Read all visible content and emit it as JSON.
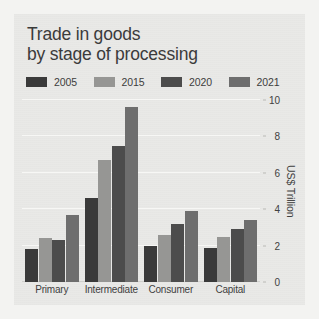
{
  "figure": {
    "title_line1": "Trade in goods",
    "title_line2": "by stage of processing",
    "background": "#e9e9e7",
    "page_background": "#f3f3f1"
  },
  "legend": {
    "position": "top",
    "entries": [
      {
        "label": "2005",
        "color": "#3a3a3a"
      },
      {
        "label": "2015",
        "color": "#969694"
      },
      {
        "label": "2020",
        "color": "#4c4c4c"
      },
      {
        "label": "2021",
        "color": "#6e6e6e"
      }
    ]
  },
  "chart_data": {
    "type": "bar",
    "title": "Trade in goods by stage of processing",
    "xlabel": "",
    "ylabel": "US$ Trillion",
    "categories": [
      "Primary",
      "Intermediate",
      "Consumer",
      "Capital"
    ],
    "series": [
      {
        "name": "2005",
        "color": "#3a3a3a",
        "values": [
          1.8,
          4.6,
          2.0,
          1.85
        ]
      },
      {
        "name": "2015",
        "color": "#969694",
        "values": [
          2.4,
          6.7,
          2.6,
          2.5
        ]
      },
      {
        "name": "2020",
        "color": "#4c4c4c",
        "values": [
          2.3,
          7.5,
          3.2,
          2.9
        ]
      },
      {
        "name": "2021",
        "color": "#6e6e6e",
        "values": [
          3.7,
          9.6,
          3.9,
          3.4
        ]
      }
    ],
    "ylim": [
      0,
      10
    ],
    "yticks": [
      0,
      2,
      4,
      6,
      8,
      10
    ],
    "ytick_labels": [
      "0",
      "2",
      "4",
      "6",
      "8",
      "10"
    ],
    "grid": true,
    "grid_axis": "y",
    "yaxis_side": "right",
    "legend_position": "top"
  }
}
